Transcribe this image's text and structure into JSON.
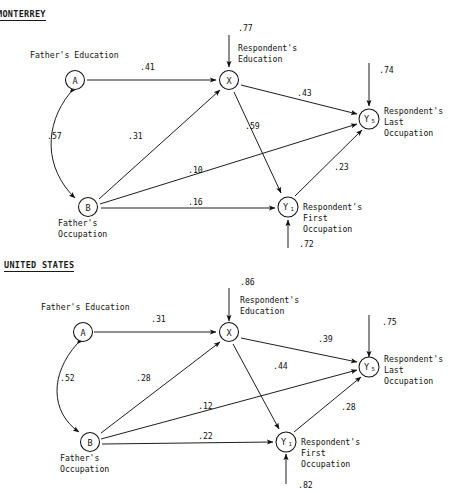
{
  "figure": {
    "type": "path-diagram",
    "panels": [
      {
        "id": "monterrey",
        "title": "MONTERREY",
        "nodes": [
          {
            "id": "A",
            "symbol": "A",
            "subscript": "",
            "label": "Father's Education",
            "label_lines": [
              "Father's Education"
            ]
          },
          {
            "id": "B",
            "symbol": "B",
            "subscript": "",
            "label": "Father's Occupation",
            "label_lines": [
              "Father's",
              "Occupation"
            ]
          },
          {
            "id": "X",
            "symbol": "X",
            "subscript": "",
            "label": "Respondent's Education",
            "label_lines": [
              "Respondent's",
              "Education"
            ]
          },
          {
            "id": "Y1",
            "symbol": "Y",
            "subscript": "1",
            "label": "Respondent's First Occupation",
            "label_lines": [
              "Respondent's",
              "First",
              "Occupation"
            ]
          },
          {
            "id": "Y5",
            "symbol": "Y",
            "subscript": "5",
            "label": "Respondent's Last Occupation",
            "label_lines": [
              "Respondent's",
              "Last",
              "Occupation"
            ]
          }
        ],
        "paths": [
          {
            "from": "A",
            "to": "X",
            "coefficient": ".41"
          },
          {
            "from": "B",
            "to": "X",
            "coefficient": ".31"
          },
          {
            "from": "A",
            "to": "B",
            "coefficient": ".57",
            "kind": "correlation"
          },
          {
            "from": "X",
            "to": "Y5",
            "coefficient": ".43"
          },
          {
            "from": "X",
            "to": "Y1",
            "coefficient": ".59"
          },
          {
            "from": "B",
            "to": "Y5",
            "coefficient": ".10"
          },
          {
            "from": "B",
            "to": "Y1",
            "coefficient": ".16"
          },
          {
            "from": "Y1",
            "to": "Y5",
            "coefficient": ".23"
          }
        ],
        "residuals": [
          {
            "to": "X",
            "coefficient": ".77"
          },
          {
            "to": "Y5",
            "coefficient": ".74"
          },
          {
            "to": "Y1",
            "coefficient": ".72"
          }
        ]
      },
      {
        "id": "united-states",
        "title": "UNITED STATES",
        "nodes": [
          {
            "id": "A",
            "symbol": "A",
            "subscript": "",
            "label": "Father's Education",
            "label_lines": [
              "Father's Education"
            ]
          },
          {
            "id": "B",
            "symbol": "B",
            "subscript": "",
            "label": "Father's Occupation",
            "label_lines": [
              "Father's",
              "Occupation"
            ]
          },
          {
            "id": "X",
            "symbol": "X",
            "subscript": "",
            "label": "Respondent's Education",
            "label_lines": [
              "Respondent's",
              "Education"
            ]
          },
          {
            "id": "Y1",
            "symbol": "Y",
            "subscript": "1",
            "label": "Respondent's First Occupation",
            "label_lines": [
              "Respondent's",
              "First",
              "Occupation"
            ]
          },
          {
            "id": "Y5",
            "symbol": "Y",
            "subscript": "5",
            "label": "Respondent's Last Occupation",
            "label_lines": [
              "Respondent's",
              "Last",
              "Occupation"
            ]
          }
        ],
        "paths": [
          {
            "from": "A",
            "to": "X",
            "coefficient": ".31"
          },
          {
            "from": "B",
            "to": "X",
            "coefficient": ".28"
          },
          {
            "from": "A",
            "to": "B",
            "coefficient": ".52",
            "kind": "correlation"
          },
          {
            "from": "X",
            "to": "Y5",
            "coefficient": ".39"
          },
          {
            "from": "X",
            "to": "Y1",
            "coefficient": ".44"
          },
          {
            "from": "B",
            "to": "Y5",
            "coefficient": ".12"
          },
          {
            "from": "B",
            "to": "Y1",
            "coefficient": ".22"
          },
          {
            "from": "Y1",
            "to": "Y5",
            "coefficient": ".28"
          }
        ],
        "residuals": [
          {
            "to": "X",
            "coefficient": ".86"
          },
          {
            "to": "Y5",
            "coefficient": ".75"
          },
          {
            "to": "Y1",
            "coefficient": ".82"
          }
        ]
      }
    ]
  },
  "monterrey": {
    "title": "MONTERREY",
    "coef": {
      "a_x": ".41",
      "b_x": ".31",
      "a_b": ".57",
      "x_y5": ".43",
      "x_y1": ".59",
      "b_y5": ".10",
      "b_y1": ".16",
      "y1_y5": ".23",
      "res_x": ".77",
      "res_y5": ".74",
      "res_y1": ".72"
    },
    "labels": {
      "a": "Father's Education",
      "b_line1": "Father's",
      "b_line2": "Occupation",
      "x_line1": "Respondent's",
      "x_line2": "Education",
      "y5_line1": "Respondent's",
      "y5_line2": "Last",
      "y5_line3": "Occupation",
      "y1_line1": "Respondent's",
      "y1_line2": "First",
      "y1_line3": "Occupation"
    },
    "nodes": {
      "a": "A",
      "b": "B",
      "x": "X",
      "y5": "Y",
      "y5_sub": "5",
      "y1": "Y",
      "y1_sub": "1"
    }
  },
  "us": {
    "title": "UNITED STATES",
    "coef": {
      "a_x": ".31",
      "b_x": ".28",
      "a_b": ".52",
      "x_y5": ".39",
      "x_y1": ".44",
      "b_y5": ".12",
      "b_y1": ".22",
      "y1_y5": ".28",
      "res_x": ".86",
      "res_y5": ".75",
      "res_y1": ".82"
    },
    "labels": {
      "a": "Father's Education",
      "b_line1": "Father's",
      "b_line2": "Occupation",
      "x_line1": "Respondent's",
      "x_line2": "Education",
      "y5_line1": "Respondent's",
      "y5_line2": "Last",
      "y5_line3": "Occupation",
      "y1_line1": "Respondent's",
      "y1_line2": "First",
      "y1_line3": "Occupation"
    },
    "nodes": {
      "a": "A",
      "b": "B",
      "x": "X",
      "y5": "Y",
      "y5_sub": "5",
      "y1": "Y",
      "y1_sub": "1"
    }
  }
}
